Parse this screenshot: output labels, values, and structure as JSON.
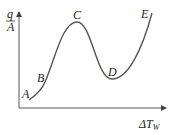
{
  "diagram": {
    "y_label_num": "q",
    "y_label_den": "A",
    "x_label": "ΔT",
    "x_label_sub": "W",
    "points": [
      {
        "label": "A",
        "x": 30,
        "y": 100
      },
      {
        "label": "B",
        "x": 45,
        "y": 82
      },
      {
        "label": "C",
        "x": 77,
        "y": 22
      },
      {
        "label": "D",
        "x": 112,
        "y": 79
      },
      {
        "label": "E",
        "x": 152,
        "y": 12
      }
    ],
    "stroke_color": "#555555"
  }
}
